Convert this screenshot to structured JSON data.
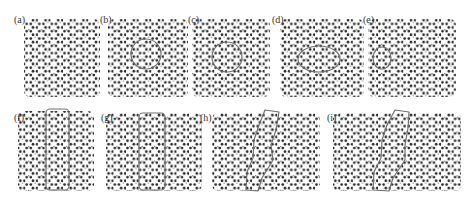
{
  "figure": {
    "colors": {
      "atom": "#2a2a2a",
      "atom_small": "#6a6a6a",
      "outline": "#707070",
      "background": "#ffffff"
    },
    "panels": [
      {
        "id": "a",
        "label": "(a)",
        "label_pos": [
          14,
          15
        ],
        "lattice": {
          "x": 24,
          "y": 19,
          "w": 76,
          "h": 78
        },
        "highlight": null
      },
      {
        "id": "b",
        "label": "(b)",
        "label_pos": [
          100,
          15
        ],
        "lattice": {
          "x": 108,
          "y": 19,
          "w": 80,
          "h": 78
        },
        "highlight": {
          "shape": "circle",
          "cx": 146,
          "cy": 54,
          "r": 15
        }
      },
      {
        "id": "c",
        "label": "(c)",
        "label_pos": [
          188,
          15
        ],
        "lattice": {
          "x": 192,
          "y": 19,
          "w": 78,
          "h": 78
        },
        "highlight": {
          "shape": "circle",
          "cx": 227,
          "cy": 57,
          "r": 15
        }
      },
      {
        "id": "d",
        "label": "(d)",
        "label_pos": [
          272,
          15
        ],
        "lattice": {
          "x": 280,
          "y": 19,
          "w": 84,
          "h": 78
        },
        "highlight": {
          "shape": "ellipse",
          "cx": 319,
          "cy": 59,
          "rx": 21,
          "ry": 13
        }
      },
      {
        "id": "e",
        "label": "(e)",
        "label_pos": [
          363,
          15
        ],
        "lattice": {
          "x": 368,
          "y": 19,
          "w": 88,
          "h": 78
        },
        "highlight": {
          "shape": "ellipse",
          "cx": 382,
          "cy": 58,
          "rx": 9,
          "ry": 11
        }
      },
      {
        "id": "f",
        "label": "(f)",
        "label_pos": [
          14,
          113
        ],
        "lattice": {
          "x": 18,
          "y": 111,
          "w": 76,
          "h": 80
        },
        "highlight": {
          "shape": "rect",
          "x": 46,
          "y": 109,
          "w": 23,
          "h": 81,
          "r": 4
        }
      },
      {
        "id": "g",
        "label": "(g)",
        "label_pos": [
          101,
          113
        ],
        "lattice": {
          "x": 106,
          "y": 113,
          "w": 96,
          "h": 78
        },
        "highlight": {
          "shape": "rect",
          "x": 139,
          "y": 113,
          "w": 26,
          "h": 77,
          "r": 4
        }
      },
      {
        "id": "h",
        "label": "(h)",
        "label_pos": [
          200,
          113
        ],
        "lattice": {
          "x": 212,
          "y": 113,
          "w": 108,
          "h": 78
        },
        "highlight": {
          "shape": "path",
          "d": "M265,110 L279,112 L276,130 L271,145 L273,160 L262,178 L258,191 L246,190 L247,172 L253,158 L254,140 L259,125 Z"
        }
      },
      {
        "id": "i",
        "label": "(i)",
        "label_pos": [
          327,
          113
        ],
        "lattice": {
          "x": 333,
          "y": 113,
          "w": 128,
          "h": 78
        },
        "highlight": {
          "shape": "path",
          "d": "M395,110 L409,112 L408,128 L405,145 L405,160 L393,178 L389,191 L373,190 L374,172 L381,158 L382,140 L387,125 Z"
        }
      }
    ]
  }
}
